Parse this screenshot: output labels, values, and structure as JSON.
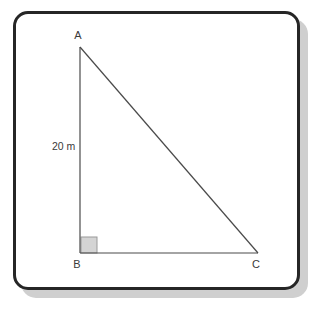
{
  "figure": {
    "background_color": "#ffffff",
    "frame": {
      "name": "rounded-border-frame",
      "border_color": "#262626",
      "border_width": 3,
      "corner_radius": 15,
      "fill_color": "#ffffff",
      "shadow_color": "#cfcfcf"
    },
    "line_color": "#4a4a4a",
    "line_width": 1,
    "text_color": "#3a3a3a"
  },
  "vertices": [
    {
      "id": "A",
      "label": "A",
      "x": 80,
      "y": 47,
      "label_x": 78,
      "label_y": 39
    },
    {
      "id": "B",
      "label": "B",
      "x": 80,
      "y": 253,
      "label_x": 77,
      "label_y": 268
    },
    {
      "id": "C",
      "label": "C",
      "x": 258,
      "y": 253,
      "label_x": 256,
      "label_y": 268
    }
  ],
  "sides": [
    {
      "id": "AB",
      "name": "vertical-leg",
      "from": "A",
      "to": "B",
      "label": "20 m",
      "label_x": 52,
      "label_y": 150
    },
    {
      "id": "BC",
      "name": "horizontal-leg",
      "from": "B",
      "to": "C",
      "label": ""
    },
    {
      "id": "AC",
      "name": "hypotenuse",
      "from": "A",
      "to": "C",
      "label": ""
    }
  ],
  "right_angle": {
    "at": "B",
    "name": "right-angle-marker",
    "x": 80,
    "y": 237,
    "size": 16,
    "fill_color": "#d4d4d4",
    "stroke_color": "#9a9a9a"
  }
}
